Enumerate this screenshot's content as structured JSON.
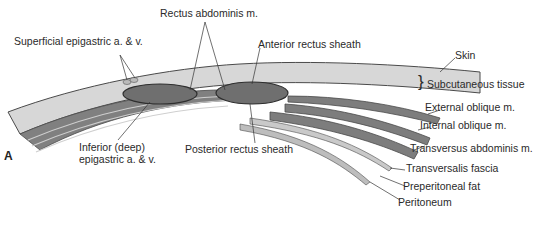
{
  "figure": {
    "panel_letter": "A",
    "colors": {
      "skin_fill": "#d7d7d7",
      "muscle_fill": "#7a7a7a",
      "rectus_fill": "#6f6f6f",
      "fascia_fill": "#c9c9c9",
      "outline": "#4a4a4a",
      "text": "#2a2a2a"
    },
    "labels": {
      "rectus_abdominis": "Rectus abdominis m.",
      "superficial_epigastric": "Superficial epigastric a. & v.",
      "anterior_rectus_sheath": "Anterior rectus sheath",
      "skin": "Skin",
      "subcutaneous_tissue": "Subcutaneous tissue",
      "external_oblique": "External oblique m.",
      "internal_oblique": "Internal oblique m.",
      "transversus_abdominis": "Transversus abdominis m.",
      "transversalis_fascia": "Transversalis fascia",
      "preperitoneal_fat": "Preperitoneal fat",
      "peritoneum": "Peritoneum",
      "inferior_epigastric_line1": "Inferior (deep)",
      "inferior_epigastric_line2": "epigastric a. & v.",
      "posterior_rectus_sheath": "Posterior rectus sheath",
      "brace": "}"
    }
  }
}
